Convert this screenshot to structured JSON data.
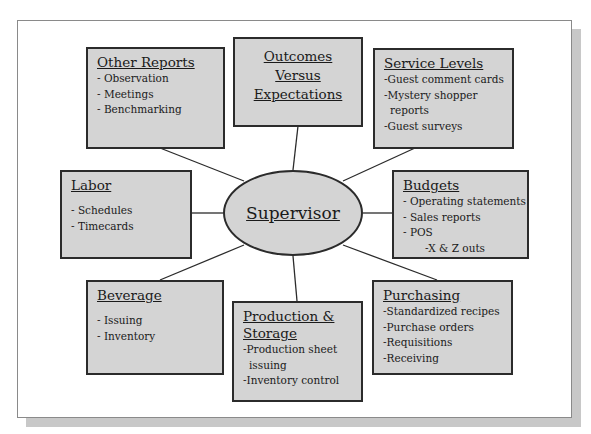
{
  "center": {
    "label": "Supervisor"
  },
  "nodes": {
    "other_reports": {
      "title": "Other Reports",
      "items": [
        "- Observation",
        "- Meetings",
        "- Benchmarking"
      ]
    },
    "outcomes": {
      "title_lines": [
        "Outcomes",
        "Versus",
        "Expectations"
      ]
    },
    "service_levels": {
      "title": "Service Levels",
      "items": [
        "-Guest comment cards",
        "-Mystery shopper",
        "reports",
        "-Guest surveys"
      ]
    },
    "labor": {
      "title": "Labor",
      "items": [
        "- Schedules",
        "- Timecards"
      ]
    },
    "budgets": {
      "title": "Budgets",
      "items": [
        "- Operating statements",
        "- Sales reports",
        "- POS",
        "-X & Z outs"
      ]
    },
    "beverage": {
      "title": "Beverage",
      "items": [
        "- Issuing",
        "- Inventory"
      ]
    },
    "production": {
      "title_lines": [
        "Production &",
        "Storage"
      ],
      "items": [
        "-Production sheet",
        "issuing",
        "-Inventory control"
      ]
    },
    "purchasing": {
      "title": "Purchasing",
      "items": [
        "-Standardized recipes",
        "-Purchase orders",
        "-Requisitions",
        "-Receiving"
      ]
    }
  },
  "colors": {
    "box_fill": "#d4d4d4",
    "border": "#2b2b2b",
    "shadow": "#c8c8c8"
  }
}
